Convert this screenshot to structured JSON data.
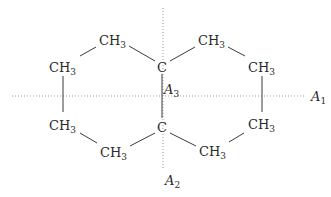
{
  "diagram": {
    "title": "",
    "atoms": {
      "c_top": {
        "label": "C"
      },
      "c_bottom": {
        "label": "C"
      },
      "top_left": {
        "label": "CH",
        "sub": "3"
      },
      "top_right": {
        "label": "CH",
        "sub": "3"
      },
      "upper_left": {
        "label": "CH",
        "sub": "3"
      },
      "upper_right": {
        "label": "CH",
        "sub": "3"
      },
      "lower_left": {
        "label": "CH",
        "sub": "3"
      },
      "lower_right": {
        "label": "CH",
        "sub": "3"
      },
      "bottom_left": {
        "label": "CH",
        "sub": "3"
      },
      "bottom_right": {
        "label": "CH",
        "sub": "3"
      }
    },
    "axes": {
      "a1": {
        "label": "A",
        "sub": "1"
      },
      "a2": {
        "label": "A",
        "sub": "2"
      },
      "a3": {
        "label": "A",
        "sub": "3"
      }
    },
    "colors": {
      "bond": "#3a3a3a",
      "axis": "#9a9a9a",
      "text": "#2a2a2a"
    }
  }
}
